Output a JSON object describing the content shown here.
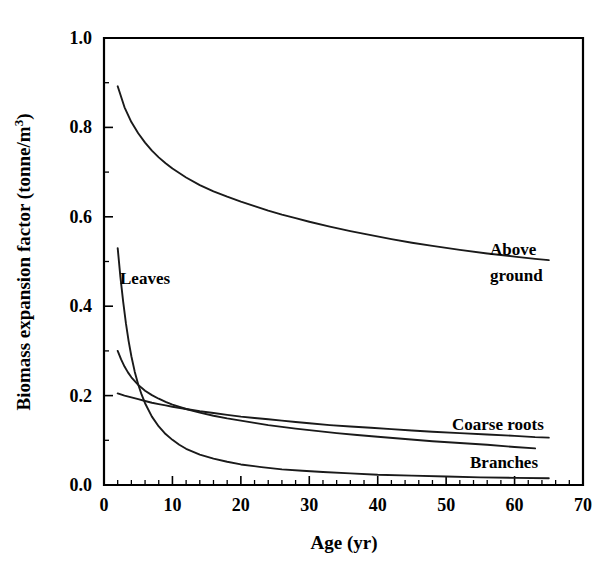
{
  "chart_data": {
    "type": "line",
    "title": "",
    "xlabel": "Age (yr)",
    "ylabel": "Biomass expansion factor (tonne/m3)",
    "ylabel_parts": {
      "main": "Biomass expansion factor (tonne/m",
      "superscript": "3",
      "tail": ")"
    },
    "xlim": [
      0,
      70
    ],
    "ylim": [
      0.0,
      1.0
    ],
    "xticks": [
      0,
      10,
      20,
      30,
      40,
      50,
      60,
      70
    ],
    "xtick_labels": [
      "0",
      "10",
      "20",
      "30",
      "40",
      "50",
      "60",
      "70"
    ],
    "xminor_step": 2,
    "yticks": [
      0.0,
      0.2,
      0.4,
      0.6,
      0.8,
      1.0
    ],
    "ytick_labels": [
      "0.0",
      "0.2",
      "0.4",
      "0.6",
      "0.8",
      "1.0"
    ],
    "yminor_step": 0.1,
    "grid": false,
    "legend_position": "inline-annotations",
    "line_color": "#1a1a1a",
    "series": [
      {
        "name": "Above ground",
        "label": "Above\nground",
        "label_line1": "Above",
        "label_line2": "ground",
        "x": [
          2,
          3,
          4,
          5,
          6,
          7,
          8,
          9,
          10,
          12,
          14,
          16,
          18,
          20,
          22,
          24,
          26,
          28,
          30,
          33,
          36,
          39,
          42,
          45,
          48,
          52,
          56,
          60,
          63,
          65
        ],
        "values": [
          0.892,
          0.845,
          0.812,
          0.787,
          0.766,
          0.748,
          0.733,
          0.72,
          0.708,
          0.688,
          0.671,
          0.657,
          0.645,
          0.634,
          0.624,
          0.614,
          0.605,
          0.597,
          0.589,
          0.578,
          0.568,
          0.559,
          0.55,
          0.542,
          0.535,
          0.526,
          0.518,
          0.511,
          0.506,
          0.503
        ]
      },
      {
        "name": "Leaves",
        "label": "Leaves",
        "x": [
          2,
          2.4,
          2.8,
          3.2,
          3.6,
          4,
          4.5,
          5,
          5.5,
          6,
          7,
          8,
          9,
          10,
          11,
          12,
          14,
          16,
          18,
          20,
          23,
          26,
          29,
          32,
          36,
          40,
          45,
          50,
          55,
          60,
          65
        ],
        "values": [
          0.53,
          0.465,
          0.41,
          0.362,
          0.322,
          0.288,
          0.253,
          0.225,
          0.202,
          0.183,
          0.153,
          0.131,
          0.114,
          0.101,
          0.09,
          0.081,
          0.068,
          0.059,
          0.052,
          0.046,
          0.04,
          0.035,
          0.032,
          0.029,
          0.026,
          0.023,
          0.021,
          0.019,
          0.017,
          0.016,
          0.015
        ]
      },
      {
        "name": "Branches",
        "label": "Branches",
        "x": [
          2,
          2.5,
          3,
          3.5,
          4,
          5,
          6,
          7,
          8,
          9,
          10,
          12,
          14,
          16,
          18,
          20,
          22,
          24,
          26,
          28,
          31,
          34,
          37,
          40,
          44,
          48,
          52,
          56,
          60,
          63
        ],
        "values": [
          0.3,
          0.281,
          0.265,
          0.252,
          0.241,
          0.224,
          0.211,
          0.201,
          0.193,
          0.186,
          0.18,
          0.17,
          0.162,
          0.155,
          0.149,
          0.144,
          0.139,
          0.134,
          0.13,
          0.126,
          0.121,
          0.116,
          0.112,
          0.108,
          0.103,
          0.098,
          0.094,
          0.09,
          0.085,
          0.082
        ]
      },
      {
        "name": "Coarse roots",
        "label": "Coarse roots",
        "x": [
          2,
          3,
          4,
          5,
          6,
          7,
          8,
          9,
          10,
          12,
          14,
          16,
          18,
          20,
          22,
          24,
          26,
          28,
          30,
          33,
          36,
          39,
          42,
          45,
          48,
          52,
          56,
          60,
          63,
          65
        ],
        "values": [
          0.205,
          0.2,
          0.196,
          0.192,
          0.188,
          0.184,
          0.181,
          0.178,
          0.175,
          0.17,
          0.165,
          0.161,
          0.157,
          0.153,
          0.15,
          0.147,
          0.144,
          0.141,
          0.138,
          0.134,
          0.131,
          0.128,
          0.125,
          0.122,
          0.119,
          0.116,
          0.113,
          0.11,
          0.107,
          0.106
        ]
      }
    ],
    "annotations": [
      {
        "text": "Above ground",
        "series": "Above ground"
      },
      {
        "text": "Leaves",
        "series": "Leaves"
      },
      {
        "text": "Coarse roots",
        "series": "Coarse roots"
      },
      {
        "text": "Branches",
        "series": "Branches"
      }
    ]
  }
}
